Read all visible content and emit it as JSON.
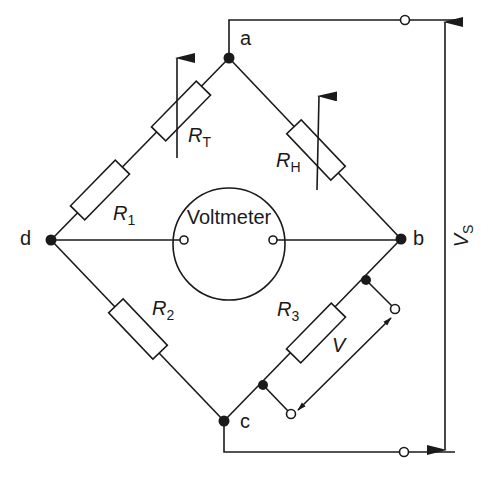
{
  "diagram": {
    "colors": {
      "ink": "#1a1a1a",
      "background": "#ffffff"
    },
    "nodes": {
      "a": {
        "label": "a"
      },
      "b": {
        "label": "b"
      },
      "c": {
        "label": "c"
      },
      "d": {
        "label": "d"
      }
    },
    "resistors": {
      "rt": {
        "symbol": "R",
        "subscript": "T",
        "variable": true
      },
      "r1": {
        "symbol": "R",
        "subscript": "1",
        "variable": false
      },
      "rh": {
        "symbol": "R",
        "subscript": "H",
        "variable": true
      },
      "r2": {
        "symbol": "R",
        "subscript": "2",
        "variable": false
      },
      "r3": {
        "symbol": "R",
        "subscript": "3",
        "variable": false
      }
    },
    "voltmeter": {
      "label": "Voltmeter"
    },
    "supply": {
      "symbol": "V",
      "subscript": "S"
    },
    "output": {
      "label": "V"
    }
  }
}
